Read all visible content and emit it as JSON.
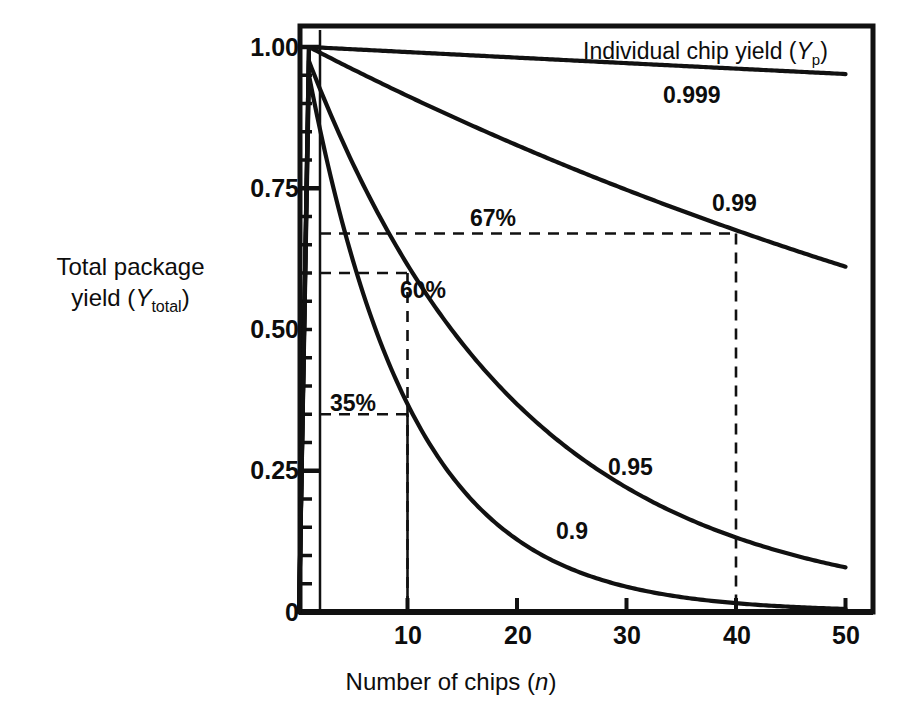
{
  "chart_data": {
    "type": "line",
    "title": "",
    "xlabel": "Number of chips (n)",
    "xlabel_plain": "Number of chips",
    "xlabel_italic_var": "n",
    "ylabel_line1": "Total package",
    "ylabel_line2_pre": "yield (Y",
    "ylabel_line2_sub": "total",
    "ylabel_line2_post": ")",
    "ylabel": "Total package yield (Ytotal)",
    "legend_header_pre": "Individual chip yield (",
    "legend_header_var": "Y",
    "legend_header_sub": "p",
    "legend_header_post": ")",
    "legend_header": "Individual chip yield (Yp)",
    "xlim": [
      0,
      52
    ],
    "ylim": [
      0,
      1.06
    ],
    "xticks": [
      10,
      20,
      30,
      40,
      50
    ],
    "xtick_labels": [
      "10",
      "20",
      "30",
      "40",
      "50"
    ],
    "yticks": [
      0,
      0.25,
      0.5,
      0.75,
      1.0
    ],
    "ytick_labels": [
      "0",
      "0.25",
      "0.50",
      "0.75",
      "1.00"
    ],
    "y_minor_step": 0.05,
    "origin_label": "0",
    "grid": false,
    "legend_position": "inline-right",
    "line_color": "#111111",
    "axis_color": "#111111",
    "background": "#ffffff",
    "series": [
      {
        "name": "0.999",
        "label": "0.999",
        "yp": 0.999,
        "label_x": 34.5,
        "label_y": 0.928,
        "x": [
          0,
          1,
          5,
          10,
          15,
          20,
          25,
          30,
          35,
          40,
          45,
          50
        ],
        "values": [
          0,
          1.0,
          0.996,
          0.99,
          0.985,
          0.98,
          0.975,
          0.97,
          0.966,
          0.961,
          0.956,
          0.951
        ]
      },
      {
        "name": "0.99",
        "label": "0.99",
        "yp": 0.99,
        "label_x": 38.5,
        "label_y": 0.736,
        "x": [
          0,
          1,
          5,
          10,
          15,
          20,
          25,
          30,
          35,
          40,
          45,
          50
        ],
        "values": [
          0,
          1.0,
          0.961,
          0.914,
          0.86,
          0.818,
          0.778,
          0.74,
          0.703,
          0.669,
          0.636,
          0.605
        ]
      },
      {
        "name": "0.95",
        "label": "0.95",
        "yp": 0.95,
        "label_x": 29.5,
        "label_y": 0.33,
        "x": [
          0,
          1,
          5,
          10,
          15,
          20,
          25,
          30,
          35,
          40,
          45,
          50
        ],
        "values": [
          0,
          0.975,
          0.774,
          0.599,
          0.463,
          0.358,
          0.277,
          0.215,
          0.166,
          0.129,
          0.099,
          0.077
        ]
      },
      {
        "name": "0.9",
        "label": "0.9",
        "yp": 0.9,
        "label_x": 24.5,
        "label_y": 0.215,
        "x": [
          0,
          1,
          5,
          10,
          15,
          20,
          25,
          30,
          35,
          40,
          45,
          50
        ],
        "values": [
          0,
          0.95,
          0.59,
          0.349,
          0.206,
          0.122,
          0.072,
          0.042,
          0.025,
          0.015,
          0.009,
          0.005
        ]
      }
    ],
    "annotations": [
      {
        "label": "67%",
        "value": 0.67,
        "at_x": 40,
        "series": "0.99",
        "style": "dashed",
        "vertical_style": "dashed"
      },
      {
        "label": "60%",
        "value": 0.6,
        "at_x": 10,
        "series": "0.95",
        "style": "dashed",
        "vertical_style": "dashed"
      },
      {
        "label": "35%",
        "value": 0.35,
        "at_x": 10,
        "series": "0.9",
        "style": "dashed",
        "vertical_style": "solid"
      }
    ]
  }
}
